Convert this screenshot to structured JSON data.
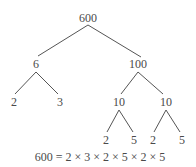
{
  "diagram": {
    "type": "factor-tree",
    "line_color": "#555555",
    "text_color": "#4a4a4a",
    "nodes": [
      {
        "id": "n600",
        "label": "600",
        "x": 88,
        "y": 18
      },
      {
        "id": "n6",
        "label": "6",
        "x": 36,
        "y": 64
      },
      {
        "id": "n100",
        "label": "100",
        "x": 138,
        "y": 64
      },
      {
        "id": "n2a",
        "label": "2",
        "x": 14,
        "y": 102
      },
      {
        "id": "n3",
        "label": "3",
        "x": 60,
        "y": 102
      },
      {
        "id": "n10a",
        "label": "10",
        "x": 119,
        "y": 102
      },
      {
        "id": "n10b",
        "label": "10",
        "x": 166,
        "y": 102
      },
      {
        "id": "n2b",
        "label": "2",
        "x": 106,
        "y": 140
      },
      {
        "id": "n5a",
        "label": "5",
        "x": 134,
        "y": 140
      },
      {
        "id": "n2c",
        "label": "2",
        "x": 153,
        "y": 140
      },
      {
        "id": "n5b",
        "label": "5",
        "x": 182,
        "y": 140
      }
    ],
    "edges": [
      {
        "from": [
          88,
          25
        ],
        "to": [
          38,
          56
        ]
      },
      {
        "from": [
          88,
          25
        ],
        "to": [
          141,
          57
        ]
      },
      {
        "from": [
          36,
          72
        ],
        "to": [
          15,
          94
        ]
      },
      {
        "from": [
          36,
          72
        ],
        "to": [
          58,
          94
        ]
      },
      {
        "from": [
          138,
          72
        ],
        "to": [
          121,
          94
        ]
      },
      {
        "from": [
          138,
          72
        ],
        "to": [
          163,
          94
        ]
      },
      {
        "from": [
          119,
          110
        ],
        "to": [
          107,
          132
        ]
      },
      {
        "from": [
          119,
          110
        ],
        "to": [
          133,
          132
        ]
      },
      {
        "from": [
          166,
          110
        ],
        "to": [
          154,
          132
        ]
      },
      {
        "from": [
          166,
          110
        ],
        "to": [
          180,
          132
        ]
      }
    ],
    "equation": "600 = 2 × 3 × 2 × 5 × 2 × 5",
    "equation_pos": {
      "x": 100,
      "y": 157
    }
  }
}
